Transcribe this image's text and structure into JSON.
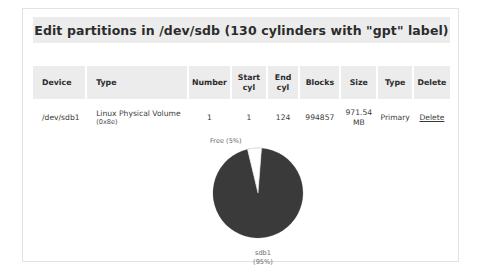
{
  "window": {
    "title": "Edit partitions in /dev/sdb (130 cylinders with \"gpt\" label)"
  },
  "table": {
    "columns": [
      {
        "key": "device",
        "label": "Device"
      },
      {
        "key": "type",
        "label": "Type"
      },
      {
        "key": "number",
        "label": "Number"
      },
      {
        "key": "start",
        "label_line1": "Start",
        "label_line2": "cyl"
      },
      {
        "key": "end",
        "label_line1": "End",
        "label_line2": "cyl"
      },
      {
        "key": "blocks",
        "label": "Blocks"
      },
      {
        "key": "size",
        "label": "Size"
      },
      {
        "key": "ptype",
        "label": "Type"
      },
      {
        "key": "delete",
        "label": "Delete"
      }
    ],
    "rows": [
      {
        "device": "/dev/sdb1",
        "type_main": "Linux Physical Volume",
        "type_code": "(0x8e)",
        "number": "1",
        "start_cyl": "1",
        "end_cyl": "124",
        "blocks": "994857",
        "size_value": "971.54",
        "size_unit": "MB",
        "partition_type": "Primary",
        "delete_label": "Delete"
      }
    ]
  },
  "chart_data": {
    "type": "pie",
    "title": "",
    "labels": [
      "Free",
      "sdb1"
    ],
    "values": [
      5,
      95
    ],
    "value_unit": "%",
    "annotations": {
      "free": "Free (5%)",
      "sdb1_line1": "sdb1",
      "sdb1_line2": "(95%)"
    },
    "colors": [
      "#ffffff",
      "#3a3a3a"
    ],
    "legend": "none",
    "grid": false
  },
  "colors": {
    "header_band": "#ececec",
    "card_border": "#e2e2e2",
    "slice_used": "#3a3a3a",
    "slice_free": "#ffffff",
    "text": "#2c2c2c"
  }
}
